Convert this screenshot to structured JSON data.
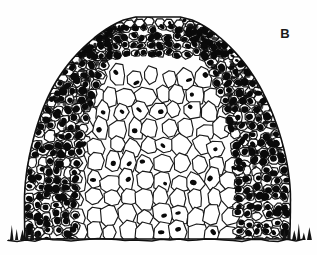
{
  "figure": {
    "panel_label": "B",
    "caption_visible": "",
    "rendering_style": "black-and-white ink drawing of a photomicrograph",
    "background_color": "#fefefe",
    "ink_color": "#101010",
    "nucleus_color": "#0a0a0a",
    "wall_color": "#1a1a1a",
    "cytoplasm_light": "#ffffff",
    "cytoplasm_dark": "#2a2a2a",
    "image_width": 317,
    "image_height": 255
  },
  "specimen": {
    "outline": {
      "apex_x": 157,
      "apex_y": 17,
      "left_base_x": 24,
      "right_base_x": 292,
      "base_y": 240,
      "left_shoulder_x": 46,
      "left_shoulder_y": 70,
      "right_shoulder_x": 268,
      "right_shoulder_y": 70,
      "left_edge_bulge_x": 21,
      "left_edge_bulge_y": 150,
      "right_edge_bulge_x": 295,
      "right_edge_bulge_y": 170
    },
    "zones": [
      {
        "name": "tunica",
        "label": "outer tunica layer",
        "description": "single file of clear elongated anticlinally-divided cells capping the dome",
        "cell_fill": "#ffffff",
        "nucleus_density": 0.25,
        "cell_width": 11,
        "cell_height": 8,
        "rows": 1
      },
      {
        "name": "subapical-dark-band",
        "label": "densely stained subapical cells",
        "description": "compact small cells with large darkly stained nuclei beneath the tunica",
        "cell_fill": "#ffffff",
        "nucleus_density": 0.95,
        "cell_width": 10,
        "cell_height": 9,
        "rows": 4
      },
      {
        "name": "peripheral-zone-left",
        "label": "left flank peripheral zone",
        "description": "dense darkly nucleated small cells forming the left flank",
        "cell_fill": "#ffffff",
        "nucleus_density": 0.92,
        "cell_width": 11,
        "cell_height": 11
      },
      {
        "name": "peripheral-zone-right",
        "label": "right flank peripheral zone",
        "description": "dense darkly nucleated small cells forming the right flank",
        "cell_fill": "#ffffff",
        "nucleus_density": 0.92,
        "cell_width": 11,
        "cell_height": 11
      },
      {
        "name": "rib-meristem",
        "label": "central rib meristem / pith core",
        "description": "large pale vacuolated cells in vertical files with sparse small nuclei",
        "cell_fill": "#ffffff",
        "nucleus_density": 0.38,
        "cell_width": 17,
        "cell_height": 21
      },
      {
        "name": "basal-cut-edge",
        "label": "basal cut margin",
        "description": "torn jagged ink hatching marking the severed base of the section",
        "cell_fill": "#151515",
        "nucleus_density": 0.0
      }
    ],
    "random_seed": 20240517
  },
  "chart_data": {
    "type": "scatter",
    "title": "",
    "xlabel": "",
    "ylabel": "",
    "note": "not a quantitative chart; cell positions are generated procedurally from zone geometry"
  }
}
